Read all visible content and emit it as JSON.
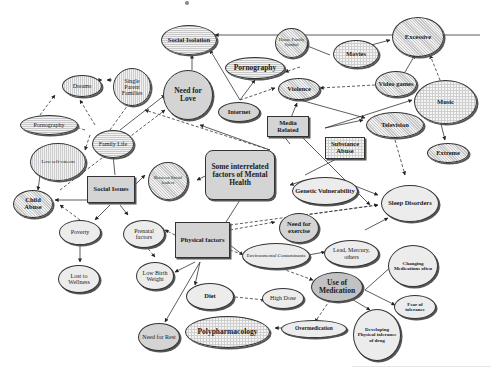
{
  "diagram": {
    "title_fragment": "y",
    "center": "Some interrelated factors of Mental Health",
    "hubs": {
      "media": "Media Related",
      "social": "Social Issues",
      "physical": "Physical factors",
      "substance": "Substance Abuse"
    },
    "nodes": {
      "social_isolation": "Social Isolation",
      "need_for_love": "Need for Love",
      "pornography_top": "Pornography",
      "internet": "Internet",
      "violence": "Violence",
      "movies": "Movies",
      "house_family_symbol": "House Family Symbol",
      "excessive": "Excessive",
      "video_games": "Video games",
      "music": "Music",
      "television": "Television",
      "extreme": "Extreme",
      "dreams": "Dreams",
      "single_parent_families": "Single Parent Families",
      "pornography_left": "Pornography",
      "family_life": "Family Life",
      "low_self_esteem": "Low self-esteem",
      "child_abuse": "Child Abuse",
      "between_social_leaders": "Between Social leaders",
      "poverty": "Poverty",
      "lost_to_wellness": "Lost to Wellness",
      "prenatal_factors": "Prenatal factors",
      "low_birth_weight": "Low Birth Weight",
      "genetic_vulnerability": "Genetic Vulnerability",
      "sleep_disorders": "Sleep Disorders",
      "need_for_exercise": "Need for exercise",
      "environmental_contaminants": "Environmental Contaminants",
      "lead_mercury": "Lead, Mercury, others",
      "use_of_medication": "Use of Medication",
      "changing_medications": "Changing Medications often",
      "fear_of_tolerance": "Fear of tolerance",
      "diet": "Diet",
      "high_dose": "High Dose",
      "need_for_rest": "Need for Rest",
      "polypharmacology": "Polypharmacology",
      "overmedication": "Overmedication",
      "developing_tolerance": "Developing Physical tolerance of drug"
    }
  }
}
